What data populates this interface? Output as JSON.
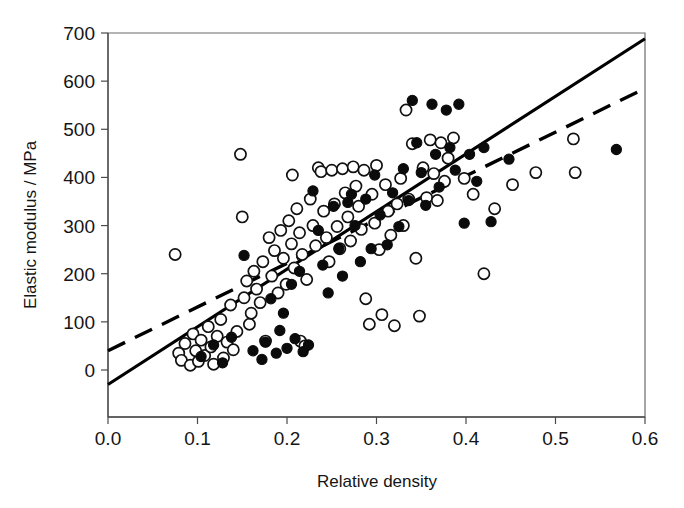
{
  "chart_data": {
    "type": "scatter",
    "title": "",
    "xlabel": "Relative density",
    "ylabel": "Elastic modulus / MPa",
    "xlim": [
      0.0,
      0.6
    ],
    "ylim": [
      -100,
      700
    ],
    "grid": false,
    "legend": "none",
    "x_ticks": [
      "0.0",
      "0.1",
      "0.2",
      "0.3",
      "0.4",
      "0.5",
      "0.6"
    ],
    "x_tick_values": [
      0.0,
      0.1,
      0.2,
      0.3,
      0.4,
      0.5,
      0.6
    ],
    "y_ticks": [
      "0",
      "100",
      "200",
      "300",
      "400",
      "500",
      "600",
      "700"
    ],
    "y_tick_values": [
      0,
      100,
      200,
      300,
      400,
      500,
      600,
      700
    ],
    "series": [
      {
        "name": "open-circles",
        "marker": "open circle",
        "marker_fill": "#ffffff",
        "marker_edge": "#111111",
        "points": [
          [
            0.075,
            240
          ],
          [
            0.079,
            35
          ],
          [
            0.082,
            20
          ],
          [
            0.086,
            55
          ],
          [
            0.092,
            10
          ],
          [
            0.095,
            75
          ],
          [
            0.098,
            40
          ],
          [
            0.101,
            18
          ],
          [
            0.104,
            62
          ],
          [
            0.108,
            30
          ],
          [
            0.112,
            90
          ],
          [
            0.115,
            48
          ],
          [
            0.118,
            12
          ],
          [
            0.122,
            70
          ],
          [
            0.126,
            105
          ],
          [
            0.129,
            25
          ],
          [
            0.133,
            58
          ],
          [
            0.137,
            135
          ],
          [
            0.14,
            42
          ],
          [
            0.144,
            80
          ],
          [
            0.148,
            448
          ],
          [
            0.15,
            318
          ],
          [
            0.152,
            150
          ],
          [
            0.155,
            185
          ],
          [
            0.158,
            95
          ],
          [
            0.16,
            118
          ],
          [
            0.163,
            205
          ],
          [
            0.166,
            168
          ],
          [
            0.17,
            140
          ],
          [
            0.173,
            225
          ],
          [
            0.176,
            60
          ],
          [
            0.18,
            275
          ],
          [
            0.183,
            195
          ],
          [
            0.186,
            248
          ],
          [
            0.19,
            160
          ],
          [
            0.193,
            290
          ],
          [
            0.196,
            232
          ],
          [
            0.199,
            178
          ],
          [
            0.202,
            310
          ],
          [
            0.205,
            262
          ],
          [
            0.208,
            212
          ],
          [
            0.211,
            335
          ],
          [
            0.214,
            285
          ],
          [
            0.217,
            240
          ],
          [
            0.206,
            405
          ],
          [
            0.215,
            60
          ],
          [
            0.22,
            50
          ],
          [
            0.222,
            188
          ],
          [
            0.226,
            355
          ],
          [
            0.229,
            300
          ],
          [
            0.232,
            258
          ],
          [
            0.235,
            420
          ],
          [
            0.238,
            412
          ],
          [
            0.241,
            330
          ],
          [
            0.244,
            275
          ],
          [
            0.247,
            225
          ],
          [
            0.25,
            415
          ],
          [
            0.253,
            345
          ],
          [
            0.256,
            298
          ],
          [
            0.259,
            252
          ],
          [
            0.262,
            418
          ],
          [
            0.265,
            368
          ],
          [
            0.268,
            318
          ],
          [
            0.271,
            268
          ],
          [
            0.274,
            422
          ],
          [
            0.277,
            382
          ],
          [
            0.28,
            340
          ],
          [
            0.283,
            292
          ],
          [
            0.286,
            415
          ],
          [
            0.288,
            148
          ],
          [
            0.292,
            95
          ],
          [
            0.295,
            365
          ],
          [
            0.298,
            305
          ],
          [
            0.3,
            425
          ],
          [
            0.303,
            250
          ],
          [
            0.306,
            115
          ],
          [
            0.31,
            385
          ],
          [
            0.313,
            330
          ],
          [
            0.316,
            280
          ],
          [
            0.32,
            92
          ],
          [
            0.323,
            345
          ],
          [
            0.327,
            398
          ],
          [
            0.33,
            300
          ],
          [
            0.333,
            540
          ],
          [
            0.336,
            355
          ],
          [
            0.34,
            470
          ],
          [
            0.344,
            232
          ],
          [
            0.348,
            112
          ],
          [
            0.352,
            420
          ],
          [
            0.356,
            358
          ],
          [
            0.36,
            478
          ],
          [
            0.364,
            408
          ],
          [
            0.368,
            352
          ],
          [
            0.372,
            472
          ],
          [
            0.376,
            392
          ],
          [
            0.38,
            440
          ],
          [
            0.386,
            482
          ],
          [
            0.398,
            398
          ],
          [
            0.408,
            365
          ],
          [
            0.42,
            200
          ],
          [
            0.432,
            335
          ],
          [
            0.452,
            385
          ],
          [
            0.478,
            410
          ],
          [
            0.52,
            480
          ],
          [
            0.522,
            410
          ]
        ]
      },
      {
        "name": "filled-circles",
        "marker": "filled circle",
        "marker_fill": "#0b0b0b",
        "marker_edge": "#0b0b0b",
        "points": [
          [
            0.104,
            28
          ],
          [
            0.118,
            52
          ],
          [
            0.128,
            15
          ],
          [
            0.138,
            68
          ],
          [
            0.152,
            238
          ],
          [
            0.162,
            40
          ],
          [
            0.172,
            22
          ],
          [
            0.176,
            58
          ],
          [
            0.182,
            148
          ],
          [
            0.188,
            35
          ],
          [
            0.192,
            82
          ],
          [
            0.196,
            118
          ],
          [
            0.2,
            45
          ],
          [
            0.205,
            178
          ],
          [
            0.209,
            65
          ],
          [
            0.214,
            205
          ],
          [
            0.218,
            38
          ],
          [
            0.224,
            52
          ],
          [
            0.229,
            372
          ],
          [
            0.235,
            290
          ],
          [
            0.24,
            218
          ],
          [
            0.246,
            160
          ],
          [
            0.252,
            340
          ],
          [
            0.258,
            252
          ],
          [
            0.262,
            195
          ],
          [
            0.268,
            348
          ],
          [
            0.272,
            365
          ],
          [
            0.276,
            300
          ],
          [
            0.282,
            225
          ],
          [
            0.288,
            355
          ],
          [
            0.294,
            252
          ],
          [
            0.298,
            405
          ],
          [
            0.304,
            322
          ],
          [
            0.312,
            260
          ],
          [
            0.318,
            368
          ],
          [
            0.325,
            298
          ],
          [
            0.33,
            418
          ],
          [
            0.336,
            352
          ],
          [
            0.34,
            560
          ],
          [
            0.345,
            472
          ],
          [
            0.35,
            410
          ],
          [
            0.355,
            342
          ],
          [
            0.362,
            552
          ],
          [
            0.366,
            448
          ],
          [
            0.37,
            380
          ],
          [
            0.378,
            540
          ],
          [
            0.382,
            462
          ],
          [
            0.388,
            415
          ],
          [
            0.392,
            552
          ],
          [
            0.398,
            305
          ],
          [
            0.404,
            448
          ],
          [
            0.412,
            392
          ],
          [
            0.42,
            462
          ],
          [
            0.428,
            308
          ],
          [
            0.448,
            438
          ],
          [
            0.568,
            458
          ]
        ]
      }
    ],
    "fit_lines": [
      {
        "name": "solid-regression-line",
        "style": "solid",
        "x_start": 0.0,
        "y_start": -30,
        "x_end": 0.6,
        "y_end": 688
      },
      {
        "name": "dashed-regression-line",
        "style": "dashed",
        "x_start": 0.0,
        "y_start": 40,
        "x_end": 0.6,
        "y_end": 585
      }
    ]
  }
}
